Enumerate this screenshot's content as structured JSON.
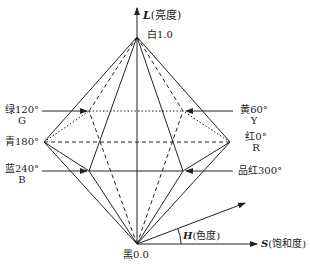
{
  "diagram": {
    "axis_l": {
      "symbol": "L",
      "label": "(亮度)"
    },
    "axis_s": {
      "symbol": "S",
      "label": "(饱和度)"
    },
    "axis_h": {
      "symbol": "H",
      "label": "(色度)"
    },
    "white": "白1.0",
    "black": "黑0.0",
    "colors": {
      "green": {
        "name": "绿120°",
        "letter": "G"
      },
      "yellow": {
        "name": "黄60°",
        "letter": "Y"
      },
      "cyan": {
        "name": "青180°"
      },
      "red": {
        "name": "红0°",
        "letter": "R"
      },
      "blue": {
        "name": "蓝240°",
        "letter": "B"
      },
      "magenta": {
        "name": "品红300°"
      }
    },
    "line_color": "#222222"
  }
}
